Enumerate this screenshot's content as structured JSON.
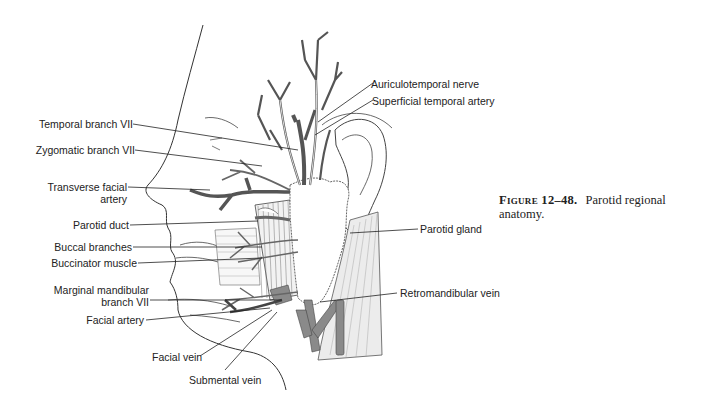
{
  "figure": {
    "number_label": "Figure 12–48.",
    "caption": "Parotid regional anatomy."
  },
  "labels": {
    "left": [
      {
        "id": "temporal-branch",
        "text": "Temporal branch VII"
      },
      {
        "id": "zygomatic-branch",
        "text": "Zygomatic branch VII"
      },
      {
        "id": "transverse-facial-artery-1",
        "text": "Transverse facial"
      },
      {
        "id": "transverse-facial-artery-2",
        "text": "artery"
      },
      {
        "id": "parotid-duct",
        "text": "Parotid duct"
      },
      {
        "id": "buccal-branches",
        "text": "Buccal branches"
      },
      {
        "id": "buccinator-muscle",
        "text": "Buccinator muscle"
      },
      {
        "id": "marginal-mandibular-1",
        "text": "Marginal mandibular"
      },
      {
        "id": "marginal-mandibular-2",
        "text": "branch VII"
      },
      {
        "id": "facial-artery",
        "text": "Facial artery"
      },
      {
        "id": "facial-vein",
        "text": "Facial vein"
      },
      {
        "id": "submental-vein",
        "text": "Submental vein"
      }
    ],
    "right": [
      {
        "id": "auriculotemporal-nerve",
        "text": "Auriculotemporal nerve"
      },
      {
        "id": "superficial-temporal-artery",
        "text": "Superficial temporal artery"
      },
      {
        "id": "parotid-gland",
        "text": "Parotid gland"
      },
      {
        "id": "retromandibular-vein",
        "text": "Retromandibular vein"
      }
    ]
  },
  "colors": {
    "ink": "#222222",
    "vessel": "#555555",
    "vein_fill": "#8a8a8a",
    "background": "#ffffff"
  }
}
